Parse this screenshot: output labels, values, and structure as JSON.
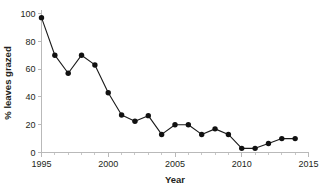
{
  "chart_data": {
    "type": "line",
    "title": "",
    "xlabel": "Year",
    "ylabel": "% leaves grazed",
    "x": [
      1995,
      1996,
      1997,
      1998,
      1999,
      2000,
      2001,
      2002,
      2003,
      2004,
      2005,
      2006,
      2007,
      2008,
      2009,
      2010,
      2011,
      2012,
      2013,
      2014
    ],
    "values": [
      97,
      70,
      57,
      70,
      63,
      43,
      27,
      22.5,
      26.5,
      13,
      20,
      20,
      13,
      17,
      13,
      3,
      3,
      6.5,
      10,
      10
    ],
    "series": [
      {
        "name": "% leaves grazed",
        "values": [
          97,
          70,
          57,
          70,
          63,
          43,
          27,
          22.5,
          26.5,
          13,
          20,
          20,
          13,
          17,
          13,
          3,
          3,
          6.5,
          10,
          10
        ]
      }
    ],
    "xlim": [
      1995,
      2015
    ],
    "ylim": [
      0,
      100
    ],
    "xticks": [
      1995,
      2000,
      2005,
      2010,
      2015
    ],
    "xticklabels": [
      "1995",
      "2000",
      "2005",
      "2010",
      "2015"
    ],
    "xminorticks": [
      1996,
      1997,
      1998,
      1999,
      2001,
      2002,
      2003,
      2004,
      2006,
      2007,
      2008,
      2009,
      2011,
      2012,
      2013,
      2014
    ],
    "yticks": [
      0,
      20,
      40,
      60,
      80,
      100
    ],
    "yticklabels": [
      "0",
      "20",
      "40",
      "60",
      "80",
      "100"
    ],
    "grid": false,
    "legend": false,
    "marker": "circle",
    "colors": {
      "line": "#1a1a1a",
      "marker": "#111111",
      "axis": "#b9b9b9",
      "text": "#231f20",
      "background": "#ffffff"
    }
  }
}
